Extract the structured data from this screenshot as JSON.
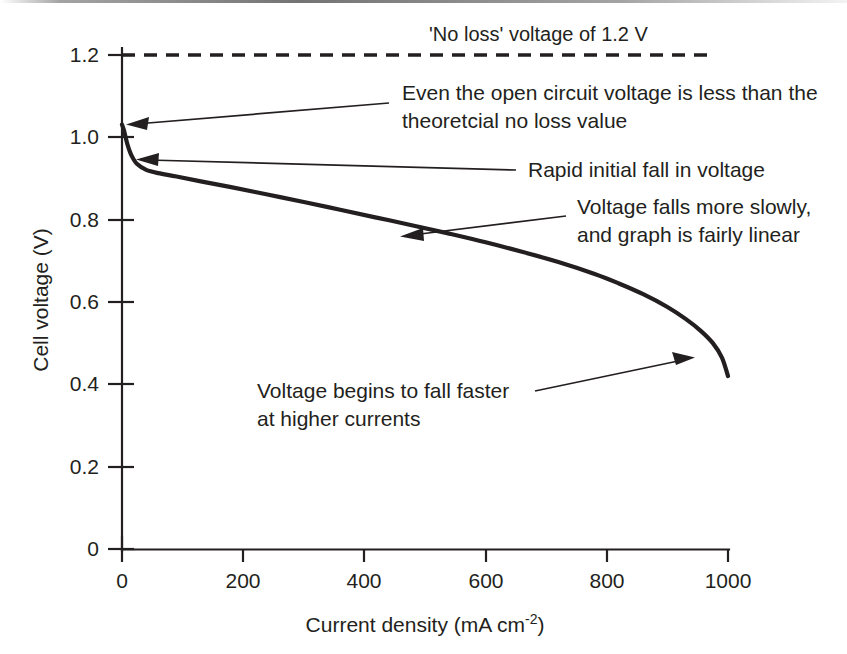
{
  "figure": {
    "caption_present": false,
    "background_color": "#ffffff",
    "ink_color": "#231f20"
  },
  "chart_data": {
    "type": "line",
    "title": "",
    "xlabel": "Current density (mA cm",
    "xlabel_superscript": "-2",
    "xlabel_suffix": ")",
    "ylabel": "Cell voltage (V)",
    "xlim": [
      0,
      1000
    ],
    "ylim": [
      0,
      1.2
    ],
    "grid": false,
    "legend": "none",
    "x_ticks": [
      "0",
      "200",
      "400",
      "600",
      "800",
      "1000"
    ],
    "x_tick_values": [
      0,
      200,
      400,
      600,
      800,
      1000
    ],
    "y_ticks": [
      "0",
      "0.2",
      "0.4",
      "0.6",
      "0.8",
      "1.0",
      "1.2"
    ],
    "y_tick_values": [
      0,
      0.2,
      0.4,
      0.6,
      0.8,
      1.0,
      1.2
    ],
    "series": [
      {
        "name": "Cell voltage polarisation curve",
        "style": "solid",
        "x": [
          0,
          3,
          6,
          10,
          16,
          25,
          40,
          60,
          90,
          130,
          180,
          240,
          300,
          360,
          420,
          480,
          540,
          600,
          660,
          720,
          780,
          820,
          860,
          900,
          930,
          955,
          975,
          990,
          1000
        ],
        "y": [
          1.031,
          1.018,
          1.0,
          0.978,
          0.955,
          0.935,
          0.921,
          0.913,
          0.905,
          0.893,
          0.879,
          0.861,
          0.843,
          0.824,
          0.805,
          0.786,
          0.766,
          0.745,
          0.722,
          0.697,
          0.668,
          0.645,
          0.619,
          0.588,
          0.559,
          0.53,
          0.5,
          0.465,
          0.42
        ]
      },
      {
        "name": "'No loss' voltage",
        "style": "dashed",
        "x": [
          0,
          1000
        ],
        "y": [
          1.2,
          1.2
        ]
      }
    ],
    "annotations": [
      {
        "id": "no-loss",
        "lines": [
          "'No loss' voltage of 1.2 V"
        ],
        "points_to_x": null,
        "points_to_y": 1.2,
        "has_arrow": false
      },
      {
        "id": "open-circuit",
        "lines": [
          "Even the open circuit voltage is less than the",
          "theoretcial no loss value"
        ],
        "points_to_x": 0,
        "points_to_y": 1.03,
        "has_arrow": true
      },
      {
        "id": "rapid-initial-fall",
        "lines": [
          "Rapid initial fall in voltage"
        ],
        "points_to_x": 10,
        "points_to_y": 0.965,
        "has_arrow": true
      },
      {
        "id": "linear-region",
        "lines": [
          "Voltage falls more slowly,",
          "and graph is fairly linear"
        ],
        "points_to_x": 430,
        "points_to_y": 0.8,
        "has_arrow": true
      },
      {
        "id": "mass-transport",
        "lines": [
          "Voltage begins to fall faster",
          "at higher currents"
        ],
        "points_to_x": 930,
        "points_to_y": 0.55,
        "has_arrow": true
      }
    ]
  }
}
